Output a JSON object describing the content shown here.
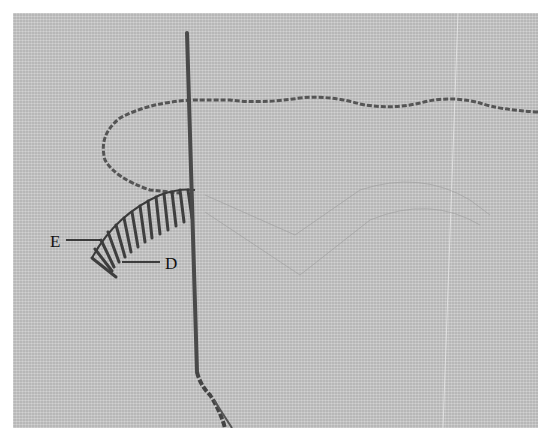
{
  "image": {
    "description": "Close-up photograph of a needle and thread stitching a curved band of slanted stitches on linen fabric, with faint pencil guide lines forming V shapes",
    "fabric_color": "#c9c9c9",
    "thread_color": "#555555",
    "needle_color": "#4a4a4a"
  },
  "labels": [
    {
      "id": "E",
      "text": "E"
    },
    {
      "id": "D",
      "text": "D"
    }
  ]
}
